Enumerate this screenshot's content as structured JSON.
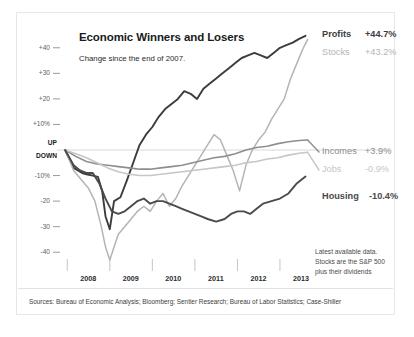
{
  "figure": {
    "title": "Economic Winners and Losers",
    "subtitle": "Change since the end of 2007.",
    "note_lines": [
      "Latest available data.",
      "Stocks are the S&P 500",
      "plus their dividends"
    ],
    "sources": "Sources: Bureau of Economic Analysis; Bloomberg; Sentier Research; Bureau of Labor Statistics; Case-Shiller"
  },
  "axis": {
    "y_ticks": [
      "+40",
      "+30",
      "+20",
      "+10%",
      "-10%",
      "-20",
      "-30",
      "-40"
    ],
    "y_zero_up": "UP",
    "y_zero_down": "DOWN",
    "x_ticks": [
      "2008",
      "2009",
      "2010",
      "2011",
      "2012",
      "2013"
    ]
  },
  "legend": [
    {
      "name": "Profits",
      "value": "+44.7%",
      "color": "#3c3c3c",
      "bold": true
    },
    {
      "name": "Stocks",
      "value": "+43.2%",
      "color": "#b4b4b4",
      "bold": false
    },
    {
      "name": "Incomes",
      "value": "+3.9%",
      "color": "#8e8e8e",
      "bold": false
    },
    {
      "name": "Jobs",
      "value": "-0.9%",
      "color": "#c6c6c6",
      "bold": false
    },
    {
      "name": "Housing",
      "value": "-10.4%",
      "color": "#4a4a4a",
      "bold": true
    }
  ],
  "chart_data": {
    "type": "line",
    "title": "Economic Winners and Losers",
    "subtitle": "Change since the end of 2007.",
    "xlabel": "",
    "ylabel": "Percent change since end of 2007",
    "xlim": [
      2007.9,
      2013.8
    ],
    "ylim": [
      -45,
      45
    ],
    "grid": false,
    "zero_line": true,
    "legend_position": "right",
    "x_tick_values": [
      2008,
      2009,
      2010,
      2011,
      2012,
      2013
    ],
    "y_tick_values": [
      40,
      30,
      20,
      10,
      0,
      -10,
      -20,
      -30,
      -40
    ],
    "series": [
      {
        "name": "Profits",
        "color": "#3c3c3c",
        "final_value": 44.7,
        "x": [
          2007.95,
          2008.15,
          2008.35,
          2008.45,
          2008.6,
          2008.72,
          2008.82,
          2008.9,
          2009.0,
          2009.1,
          2009.25,
          2009.4,
          2009.55,
          2009.7,
          2009.85,
          2010.0,
          2010.15,
          2010.3,
          2010.45,
          2010.6,
          2010.75,
          2010.9,
          2011.05,
          2011.2,
          2011.35,
          2011.5,
          2011.65,
          2011.8,
          2011.95,
          2012.1,
          2012.25,
          2012.4,
          2012.55,
          2012.7,
          2012.85,
          2013.0,
          2013.15,
          2013.3,
          2013.45,
          2013.6
        ],
        "y": [
          0,
          -7,
          -9,
          -9.5,
          -10,
          -10.5,
          -16,
          -26,
          -31,
          -20,
          -18.5,
          -12,
          -5,
          2,
          6,
          9,
          13,
          16,
          18,
          20,
          23,
          22,
          20,
          24,
          26,
          28,
          30,
          32,
          34,
          36,
          37,
          38,
          37,
          36,
          38,
          40,
          41,
          42,
          43.5,
          44.7
        ]
      },
      {
        "name": "Stocks",
        "color": "#b4b4b4",
        "final_value": 43.2,
        "x": [
          2007.95,
          2008.15,
          2008.35,
          2008.5,
          2008.65,
          2008.8,
          2008.9,
          2009.0,
          2009.1,
          2009.2,
          2009.35,
          2009.5,
          2009.65,
          2009.8,
          2009.95,
          2010.1,
          2010.25,
          2010.4,
          2010.55,
          2010.7,
          2010.85,
          2011.0,
          2011.15,
          2011.3,
          2011.45,
          2011.6,
          2011.75,
          2011.9,
          2012.05,
          2012.2,
          2012.35,
          2012.5,
          2012.65,
          2012.8,
          2012.95,
          2013.1,
          2013.25,
          2013.4,
          2013.55,
          2013.65
        ],
        "y": [
          0,
          -8,
          -12,
          -15,
          -20,
          -30,
          -38,
          -43,
          -38,
          -33,
          -30,
          -27,
          -24,
          -22,
          -24,
          -20,
          -17,
          -22,
          -19,
          -14,
          -10,
          -6,
          -2,
          2,
          6,
          4,
          -2,
          -8,
          -16,
          -6,
          0,
          4,
          7,
          12,
          16,
          20,
          28,
          34,
          40,
          43.2
        ]
      },
      {
        "name": "Incomes",
        "color": "#8e8e8e",
        "final_value": 3.9,
        "x": [
          2007.95,
          2008.2,
          2008.45,
          2008.7,
          2008.95,
          2009.2,
          2009.45,
          2009.7,
          2009.95,
          2010.2,
          2010.45,
          2010.7,
          2010.95,
          2011.2,
          2011.45,
          2011.7,
          2011.95,
          2012.2,
          2012.45,
          2012.7,
          2012.95,
          2013.2,
          2013.45,
          2013.65
        ],
        "y": [
          0,
          -2.5,
          -4.5,
          -5.5,
          -6,
          -6.5,
          -7,
          -7.5,
          -7.5,
          -7,
          -6.5,
          -6,
          -5,
          -4,
          -3,
          -2.5,
          -1.5,
          0,
          1,
          1.5,
          2.5,
          3.2,
          3.7,
          3.9
        ]
      },
      {
        "name": "Jobs",
        "color": "#c6c6c6",
        "final_value": -0.9,
        "x": [
          2007.95,
          2008.2,
          2008.45,
          2008.7,
          2008.95,
          2009.2,
          2009.45,
          2009.7,
          2009.95,
          2010.2,
          2010.45,
          2010.7,
          2010.95,
          2011.2,
          2011.45,
          2011.7,
          2011.95,
          2012.2,
          2012.45,
          2012.7,
          2012.95,
          2013.2,
          2013.45,
          2013.65
        ],
        "y": [
          0,
          -1.5,
          -3,
          -5,
          -7,
          -8.5,
          -9.5,
          -10,
          -10,
          -9.5,
          -9,
          -8.5,
          -8,
          -7.5,
          -7,
          -6.5,
          -6,
          -5,
          -4.5,
          -3.5,
          -3,
          -2,
          -1.3,
          -0.9
        ]
      },
      {
        "name": "Housing",
        "color": "#4a4a4a",
        "final_value": -10.4,
        "x": [
          2007.95,
          2008.15,
          2008.3,
          2008.45,
          2008.6,
          2008.75,
          2008.9,
          2009.05,
          2009.2,
          2009.35,
          2009.5,
          2009.65,
          2009.8,
          2009.95,
          2010.1,
          2010.25,
          2010.4,
          2010.55,
          2010.7,
          2010.85,
          2011.0,
          2011.15,
          2011.3,
          2011.5,
          2011.7,
          2011.85,
          2012.0,
          2012.15,
          2012.3,
          2012.45,
          2012.6,
          2012.8,
          2013.0,
          2013.2,
          2013.4,
          2013.6
        ],
        "y": [
          0,
          -6,
          -8,
          -9,
          -9,
          -13,
          -19,
          -24,
          -25,
          -24,
          -22,
          -20,
          -19,
          -21,
          -20,
          -20,
          -21,
          -22,
          -23,
          -24,
          -25,
          -26,
          -27,
          -28,
          -27,
          -25,
          -24,
          -24,
          -25,
          -23,
          -21,
          -20,
          -19,
          -17,
          -13,
          -10.4
        ]
      }
    ]
  }
}
